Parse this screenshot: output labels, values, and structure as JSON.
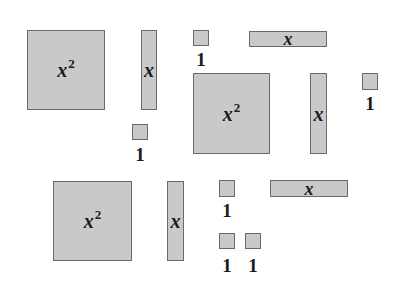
{
  "colors": {
    "tile_fill": "#c9c9c9",
    "tile_border": "#6a6a6a",
    "text": "#1a1a1a",
    "background": "#ffffff"
  },
  "tiles": {
    "x2_a": {
      "base": "x",
      "exp": "2"
    },
    "x2_b": {
      "base": "x",
      "exp": "2"
    },
    "x2_c": {
      "base": "x",
      "exp": "2"
    },
    "xv_a": {
      "label": "x"
    },
    "xv_b": {
      "label": "x"
    },
    "xv_c": {
      "label": "x"
    },
    "xh_a": {
      "label": "x"
    },
    "xh_b": {
      "label": "x"
    },
    "u_a": {
      "label": "1"
    },
    "u_b": {
      "label": "1"
    },
    "u_c": {
      "label": "1"
    },
    "u_d": {
      "label": "1"
    },
    "u_e": {
      "label": "1"
    },
    "u_f": {
      "label": "1"
    }
  },
  "summary": {
    "x_squared_tiles": 3,
    "x_tiles": 5,
    "unit_tiles": 6
  }
}
